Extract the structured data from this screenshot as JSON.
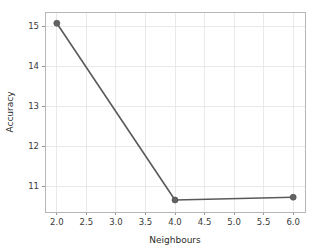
{
  "chart_data": {
    "type": "line",
    "title": "",
    "xlabel": "Neighbours",
    "ylabel": "Accuracy",
    "x": [
      2.0,
      4.0,
      6.0
    ],
    "values": [
      15.07,
      10.65,
      10.72
    ],
    "series": [
      {
        "name": "Accuracy",
        "x": [
          2.0,
          4.0,
          6.0
        ],
        "values": [
          15.07,
          10.65,
          10.72
        ]
      }
    ],
    "xlim": [
      1.8,
      6.2
    ],
    "ylim": [
      10.35,
      15.35
    ],
    "xticks": [
      2.0,
      2.5,
      3.0,
      3.5,
      4.0,
      4.5,
      5.0,
      5.5,
      6.0
    ],
    "xticklabels": [
      "2.0",
      "2.5",
      "3.0",
      "3.5",
      "4.0",
      "4.5",
      "5.0",
      "5.5",
      "6.0"
    ],
    "yticks": [
      11,
      12,
      13,
      14,
      15
    ],
    "yticklabels": [
      "11",
      "12",
      "13",
      "14",
      "15"
    ],
    "grid": true,
    "legend": null,
    "legend_position": "none",
    "marker": "circle",
    "line_color": "#5a5a5a",
    "marker_color": "#636363",
    "grid_color": "#e3e3e3",
    "background_color": "#ffffff",
    "frame_color": "#b7b7b7"
  },
  "axes": {
    "x_title": "Neighbours",
    "y_title": "Accuracy"
  }
}
